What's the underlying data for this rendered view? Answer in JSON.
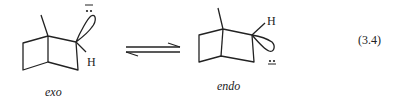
{
  "diagram": {
    "type": "chemical-equilibrium",
    "equation_number": "(3.4)",
    "reactant": {
      "name": "exo",
      "hydrogen_label": "H",
      "lone_pair": "two dots",
      "charge": "−",
      "orbital_position": "exo (up)"
    },
    "product": {
      "name": "endo",
      "hydrogen_label": "H",
      "lone_pair": "two dots",
      "charge": "−",
      "orbital_position": "endo (down)"
    },
    "arrow": "equilibrium-harpoons"
  }
}
